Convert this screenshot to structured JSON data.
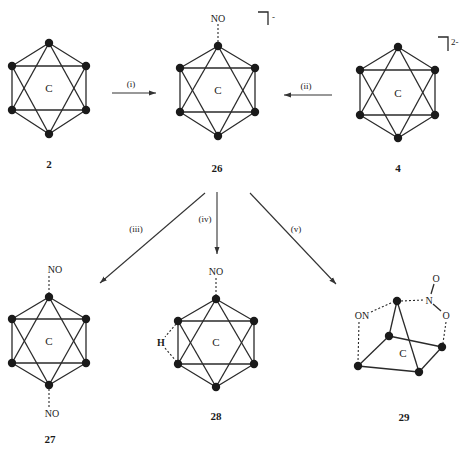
{
  "diagram": {
    "type": "reaction-scheme",
    "cluster_center_label": "C",
    "compounds": [
      {
        "id": "2",
        "label": "2",
        "substituents": []
      },
      {
        "id": "26",
        "label": "26",
        "substituents": [
          "NO"
        ],
        "charge": "-"
      },
      {
        "id": "4",
        "label": "4",
        "substituents": [],
        "charge": "2-"
      },
      {
        "id": "27",
        "label": "27",
        "substituents": [
          "NO",
          "NO"
        ]
      },
      {
        "id": "28",
        "label": "28",
        "substituents": [
          "NO",
          "H"
        ]
      },
      {
        "id": "29",
        "label": "29",
        "substituents": [
          "ON",
          "N",
          "O",
          "O"
        ]
      }
    ],
    "steps": [
      {
        "label": "(i)",
        "from": "2",
        "to": "26"
      },
      {
        "label": "(ii)",
        "from": "4",
        "to": "26"
      },
      {
        "label": "(iii)",
        "from": "26",
        "to": "27"
      },
      {
        "label": "(iv)",
        "from": "26",
        "to": "28"
      },
      {
        "label": "(v)",
        "from": "26",
        "to": "29"
      }
    ],
    "text": {
      "c": "C",
      "no": "NO",
      "on": "ON",
      "n": "N",
      "o": "O",
      "h": "H",
      "charge_26": "-",
      "charge_4": "2-"
    }
  }
}
